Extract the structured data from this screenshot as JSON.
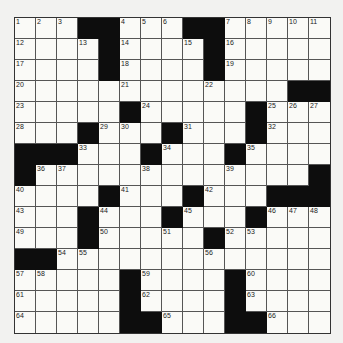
{
  "puzzle": {
    "rows": 15,
    "cols": 15,
    "grid": [
      "...##...##.....",
      "....#....#.....",
      "....#....#.....",
      ".............##",
      ".....#.....#...",
      "...#...#...#...",
      "###...#...#....",
      "#.............#",
      "....#...#...###",
      "...#...#...#...",
      "...#.....#.....",
      "##.............",
      ".....#....#....",
      ".....#....#....",
      ".....##...##..."
    ],
    "numbers": {
      "0,0": "1",
      "0,1": "2",
      "0,2": "3",
      "0,5": "4",
      "0,6": "5",
      "0,7": "6",
      "0,10": "7",
      "0,11": "8",
      "0,12": "9",
      "0,13": "10",
      "0,14": "11",
      "1,0": "12",
      "1,3": "13",
      "1,5": "14",
      "1,8": "15",
      "1,10": "16",
      "2,0": "17",
      "2,5": "18",
      "2,10": "19",
      "3,0": "20",
      "3,5": "21",
      "3,9": "22",
      "4,0": "23",
      "4,6": "24",
      "4,12": "25",
      "4,13": "26",
      "4,14": "27",
      "5,0": "28",
      "5,4": "29",
      "5,5": "30",
      "5,8": "31",
      "5,12": "32",
      "6,3": "33",
      "6,7": "34",
      "6,11": "35",
      "7,1": "36",
      "7,2": "37",
      "7,6": "38",
      "7,10": "39",
      "8,0": "40",
      "8,5": "41",
      "8,9": "42",
      "9,0": "43",
      "9,4": "44",
      "9,8": "45",
      "9,12": "46",
      "9,13": "47",
      "9,14": "48",
      "10,0": "49",
      "10,4": "50",
      "10,7": "51",
      "10,10": "52",
      "10,11": "53",
      "11,2": "54",
      "11,3": "55",
      "11,9": "56",
      "12,0": "57",
      "12,1": "58",
      "12,6": "59",
      "12,11": "60",
      "13,0": "61",
      "13,6": "62",
      "13,11": "63",
      "14,0": "64",
      "14,7": "65",
      "14,12": "66"
    }
  }
}
